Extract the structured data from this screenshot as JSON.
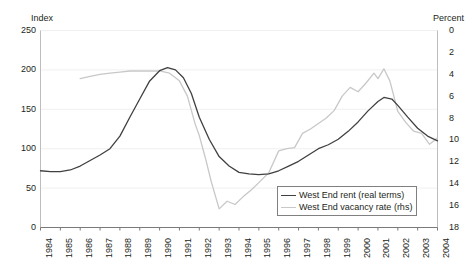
{
  "chart_data": {
    "type": "line",
    "title": "",
    "xlabel": "",
    "ylabel": "Index",
    "y2label": "Percent",
    "grid": false,
    "legend_position": "bottom-right",
    "x_ticks": [
      "1984",
      "1985",
      "1986",
      "1987",
      "1988",
      "1989",
      "1990",
      "1991",
      "1992",
      "1993",
      "1994",
      "1995",
      "1996",
      "1997",
      "1998",
      "1999",
      "2000",
      "2001",
      "2002",
      "2003",
      "2004"
    ],
    "xlim": [
      1984,
      2004
    ],
    "ylim": [
      0,
      250
    ],
    "y_ticks": [
      0,
      50,
      100,
      150,
      200,
      250
    ],
    "y2lim": [
      18,
      0
    ],
    "y2_ticks": [
      0,
      2,
      4,
      6,
      8,
      10,
      12,
      14,
      16,
      18
    ],
    "y2_inverted": true,
    "series": [
      {
        "name": "West End rent (real terms)",
        "axis": "left",
        "color": "#404040",
        "x": [
          1984.0,
          1984.5,
          1985.0,
          1985.5,
          1986.0,
          1986.5,
          1987.0,
          1987.5,
          1988.0,
          1988.5,
          1989.0,
          1989.5,
          1990.0,
          1990.4,
          1990.8,
          1991.2,
          1991.6,
          1992.0,
          1992.5,
          1993.0,
          1993.5,
          1994.0,
          1994.5,
          1995.0,
          1995.5,
          1996.0,
          1996.5,
          1997.0,
          1997.5,
          1998.0,
          1998.5,
          1999.0,
          1999.5,
          2000.0,
          2000.5,
          2001.0,
          2001.3,
          2001.7,
          2002.0,
          2002.5,
          2003.0,
          2003.5,
          2004.0
        ],
        "y": [
          72,
          71,
          71,
          73,
          78,
          85,
          92,
          100,
          116,
          140,
          163,
          186,
          199,
          203,
          200,
          190,
          170,
          140,
          112,
          90,
          78,
          70,
          68,
          67,
          68,
          72,
          78,
          84,
          92,
          100,
          105,
          112,
          122,
          134,
          148,
          160,
          165,
          163,
          155,
          140,
          126,
          116,
          110
        ]
      },
      {
        "name": "West End vacancy rate (rhs)",
        "axis": "right",
        "color": "#c8c8c8",
        "x": [
          1986.0,
          1986.5,
          1987.0,
          1987.5,
          1988.0,
          1988.5,
          1989.0,
          1989.5,
          1990.0,
          1990.5,
          1991.0,
          1991.4,
          1991.8,
          1992.0,
          1992.3,
          1992.6,
          1993.0,
          1993.4,
          1993.8,
          1994.2,
          1994.6,
          1995.0,
          1995.5,
          1996.0,
          1996.4,
          1996.8,
          1997.2,
          1997.6,
          1998.0,
          1998.4,
          1998.8,
          1999.2,
          1999.6,
          2000.0,
          2000.4,
          2000.8,
          2001.0,
          2001.3,
          2001.6,
          2002.0,
          2002.4,
          2002.8,
          2003.2,
          2003.6,
          2004.0
        ],
        "y": [
          4.4,
          4.2,
          4.0,
          3.9,
          3.8,
          3.7,
          3.7,
          3.7,
          3.7,
          3.9,
          4.6,
          6.0,
          8.6,
          9.6,
          11.6,
          13.8,
          16.3,
          15.6,
          15.9,
          15.2,
          14.6,
          13.9,
          13.0,
          11.0,
          10.8,
          10.7,
          9.4,
          9.0,
          8.5,
          8.0,
          7.3,
          6.0,
          5.2,
          5.6,
          4.8,
          3.9,
          4.4,
          3.5,
          4.6,
          7.4,
          8.4,
          9.2,
          9.4,
          10.4,
          9.8
        ]
      }
    ]
  },
  "axes": {
    "left_title": "Index",
    "right_title": "Percent"
  },
  "legend": {
    "items": [
      {
        "label": "West End rent (real terms)",
        "color": "#404040"
      },
      {
        "label": "West End vacancy rate (rhs)",
        "color": "#c8c8c8"
      }
    ]
  }
}
